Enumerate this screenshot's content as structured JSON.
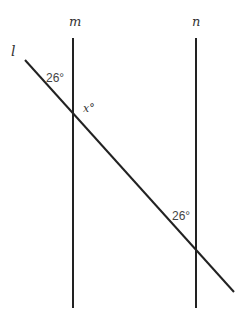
{
  "diagram": {
    "type": "parallel lines cut by a transversal",
    "lines": {
      "m": {
        "label": "m"
      },
      "n": {
        "label": "n"
      },
      "l": {
        "label": "l"
      }
    },
    "angles": {
      "top_angle": "26°",
      "unknown_angle": "x°",
      "bottom_angle": "26°"
    },
    "stroke_color": "#222222"
  }
}
